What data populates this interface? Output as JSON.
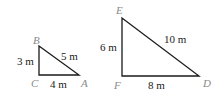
{
  "figure": {
    "triangles": [
      {
        "name": "small",
        "vertices": {
          "B": {
            "label": "B",
            "x": 39,
            "y": 46
          },
          "C": {
            "label": "C",
            "x": 39,
            "y": 75
          },
          "A": {
            "label": "A",
            "x": 79,
            "y": 75
          }
        },
        "sides": {
          "BC": "3 m",
          "CA": "4 m",
          "AB": "5 m"
        }
      },
      {
        "name": "large",
        "vertices": {
          "E": {
            "label": "E",
            "x": 122,
            "y": 18
          },
          "F": {
            "label": "F",
            "x": 122,
            "y": 76
          },
          "D": {
            "label": "D",
            "x": 199,
            "y": 76
          }
        },
        "sides": {
          "EF": "6 m",
          "FD": "8 m",
          "DE": "10 m"
        }
      }
    ],
    "colors": {
      "stroke": "#1a1a1a",
      "vertex_label": "#8a8a8a",
      "side_label": "#1a1a1a"
    }
  }
}
